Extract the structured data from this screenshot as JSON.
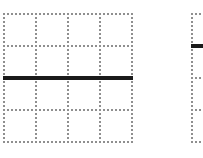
{
  "figures": [
    {
      "id": "left-grid",
      "rows": 4,
      "cols": 4,
      "x": 3,
      "y": 13,
      "cell_w": 32,
      "cell_h": 32,
      "grid_color": "#8f8f8f",
      "bold_line": {
        "orientation": "horizontal",
        "at_row_boundary": 2,
        "color": "#1a1a1a"
      }
    },
    {
      "id": "right-grid",
      "rows": 4,
      "cols": 1,
      "x": 191,
      "y": 13,
      "cell_w": 32,
      "cell_h": 32,
      "grid_color": "#8f8f8f",
      "bold_line": {
        "orientation": "horizontal",
        "at_row_boundary": 1,
        "color": "#1a1a1a"
      }
    }
  ]
}
